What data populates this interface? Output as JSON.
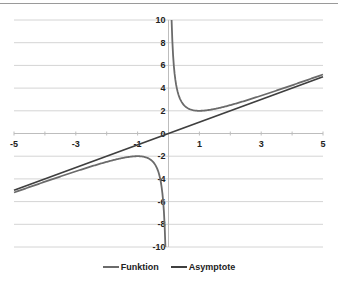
{
  "chart_data": {
    "type": "line",
    "title": "",
    "xlabel": "",
    "ylabel": "",
    "xlim": [
      -5,
      5
    ],
    "ylim": [
      -10,
      10
    ],
    "x_ticks": [
      "-5",
      "-3",
      "-1",
      "1",
      "3",
      "5"
    ],
    "y_ticks": [
      "10",
      "8",
      "6",
      "4",
      "2",
      "0",
      "-2",
      "-4",
      "-6",
      "-8",
      "-10"
    ],
    "grid": true,
    "legend_position": "bottom",
    "series": [
      {
        "name": "Funktion",
        "color": "#6b6b6b",
        "description": "f(x) = x + 1/x",
        "x": [
          -5,
          -4,
          -3,
          -2,
          -1.5,
          -1,
          -0.75,
          -0.5,
          -0.3,
          -0.2,
          -0.15,
          -0.1,
          0.1,
          0.15,
          0.2,
          0.3,
          0.5,
          0.75,
          1,
          1.5,
          2,
          3,
          4,
          5
        ],
        "values": [
          -5.2,
          -4.25,
          -3.33,
          -2.5,
          -2.17,
          -2,
          -2.08,
          -2.5,
          -3.63,
          -5.2,
          -6.82,
          -10.1,
          10.1,
          6.82,
          5.2,
          3.63,
          2.5,
          2.08,
          2,
          2.17,
          2.5,
          3.33,
          4.25,
          5.2
        ]
      },
      {
        "name": "Asymptote",
        "color": "#3f3f3f",
        "description": "y = x",
        "x": [
          -5,
          5
        ],
        "values": [
          -5,
          5
        ]
      }
    ]
  },
  "legend": {
    "items": [
      {
        "label": "Funktion",
        "color": "#6b6b6b"
      },
      {
        "label": "Asymptote",
        "color": "#3f3f3f"
      }
    ]
  }
}
